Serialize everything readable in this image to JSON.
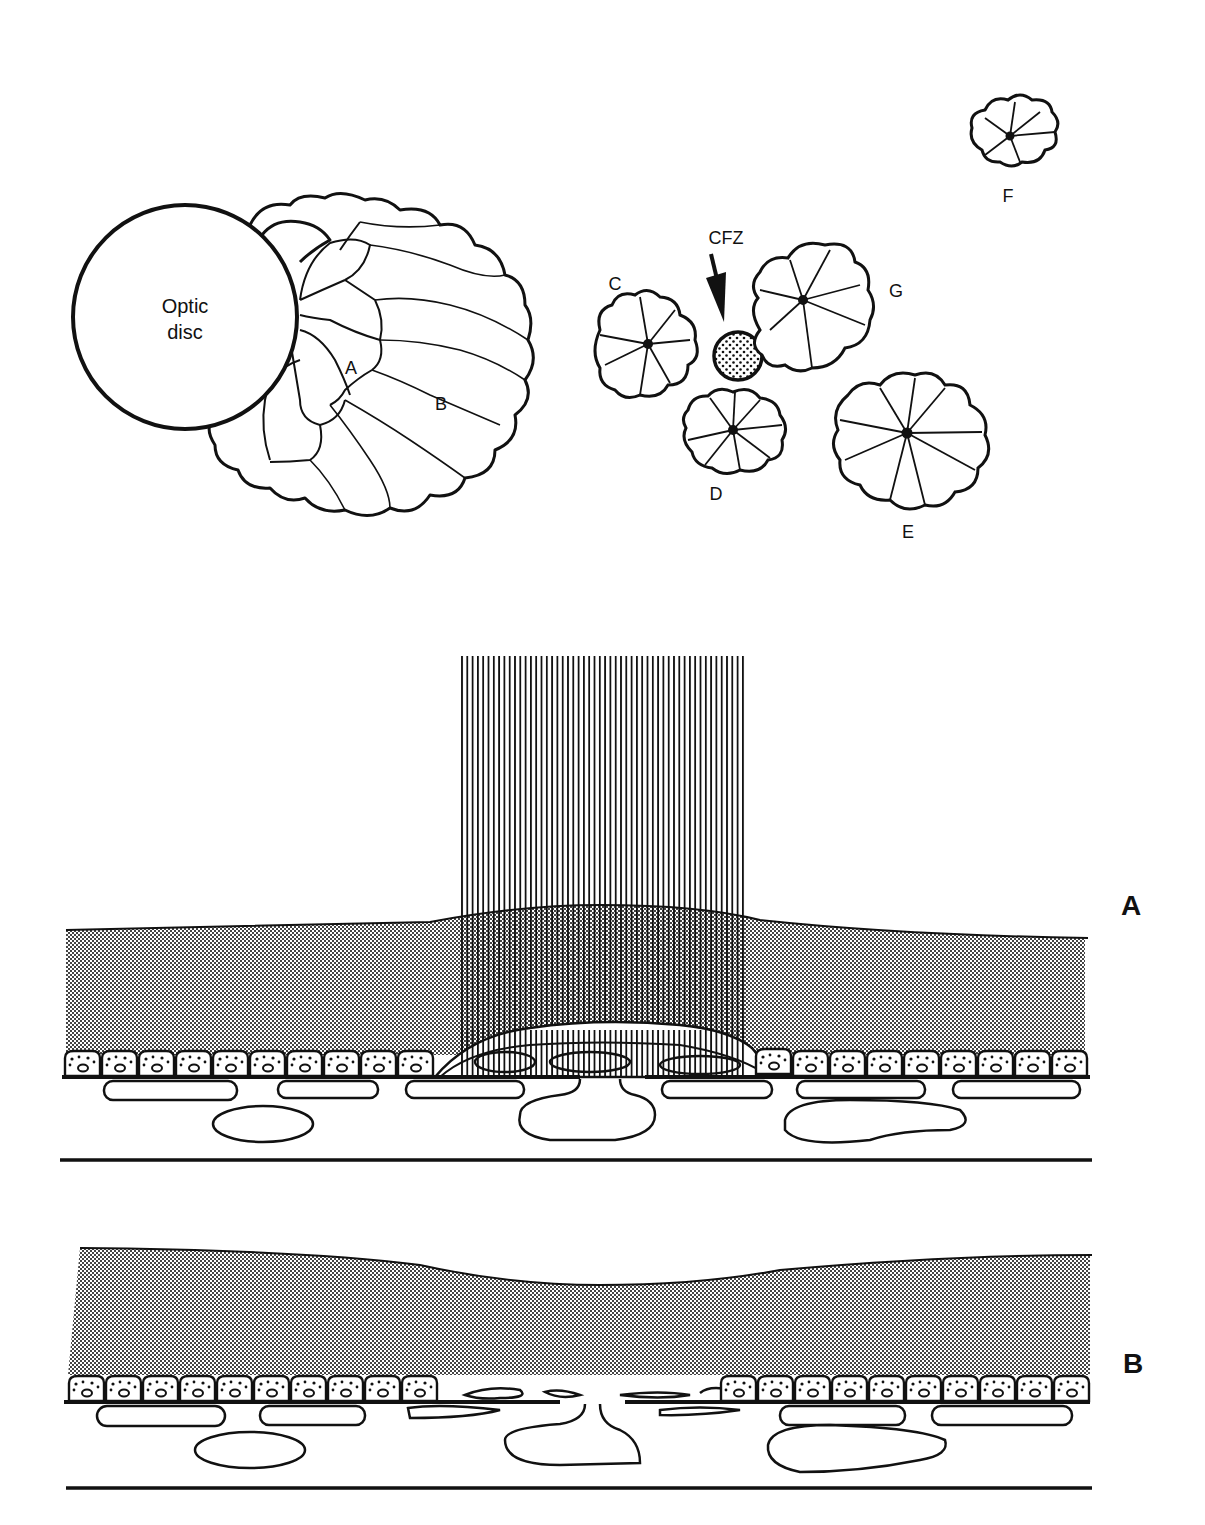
{
  "figure": {
    "top_panel": {
      "optic_disc_label_line1": "Optic",
      "optic_disc_label_line2": "disc",
      "peripapillary_labels": [
        "A",
        "B"
      ],
      "foveal_avascular_marker": "CFZ",
      "rosettes": [
        {
          "label": "C"
        },
        {
          "label": "D"
        },
        {
          "label": "E"
        },
        {
          "label": "F"
        },
        {
          "label": "G"
        }
      ]
    },
    "cross_sections": [
      {
        "label": "A",
        "description": "laser beam applied to retina with coagulated RPE"
      },
      {
        "label": "B",
        "description": "healed retina with disrupted RPE layer"
      }
    ]
  },
  "colors": {
    "ink": "#111111",
    "background": "#ffffff",
    "stipple": "#555555"
  }
}
